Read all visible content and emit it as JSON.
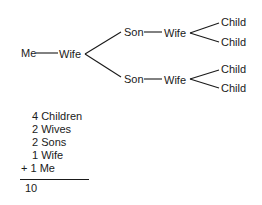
{
  "diagram": {
    "type": "family-tree",
    "root": {
      "label": "Me"
    },
    "nodes": {
      "me": "Me",
      "wife": "Wife",
      "son_top": "Son",
      "son_top_wife": "Wife",
      "child_1": "Child",
      "child_2": "Child",
      "son_bottom": "Son",
      "son_bottom_wife": "Wife",
      "child_3": "Child",
      "child_4": "Child"
    },
    "edges": [
      [
        "Me",
        "Wife"
      ],
      [
        "Wife",
        "Son (top)"
      ],
      [
        "Wife",
        "Son (bottom)"
      ],
      [
        "Son (top)",
        "Wife (top)"
      ],
      [
        "Son (bottom)",
        "Wife (bottom)"
      ],
      [
        "Wife (top)",
        "Child 1"
      ],
      [
        "Wife (top)",
        "Child 2"
      ],
      [
        "Wife (bottom)",
        "Child 3"
      ],
      [
        "Wife (bottom)",
        "Child 4"
      ]
    ]
  },
  "summary": {
    "rows": [
      {
        "text": "4 Children"
      },
      {
        "text": "2 Wives"
      },
      {
        "text": "2 Sons"
      },
      {
        "text": "1 Wife"
      },
      {
        "text": "+ 1 Me"
      }
    ],
    "total": "10"
  },
  "colors": {
    "ink": "#1a1a1a",
    "background": "#ffffff"
  }
}
